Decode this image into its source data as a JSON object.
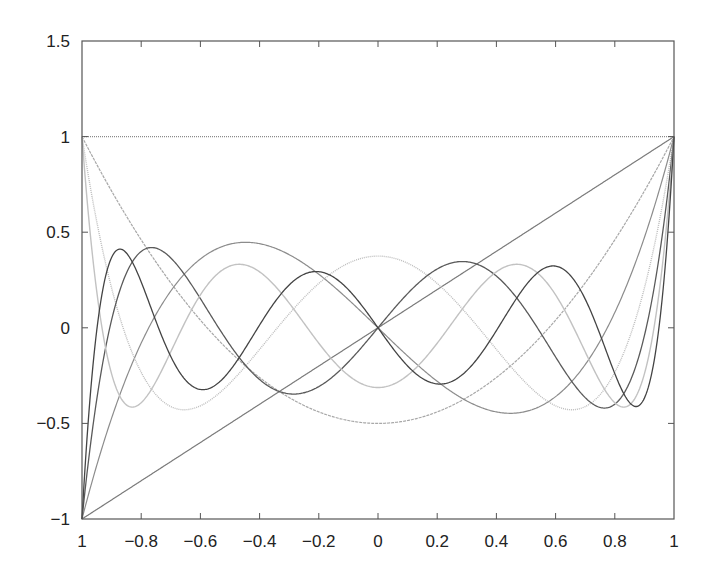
{
  "chart_data": {
    "type": "line",
    "title": "",
    "xlabel": "",
    "ylabel": "",
    "xlim": [
      -1,
      1
    ],
    "ylim": [
      -1,
      1.5
    ],
    "grid": false,
    "legend": "none",
    "x_ticks": [
      {
        "value": -1,
        "label": "1"
      },
      {
        "value": -0.8,
        "label": "−0.8"
      },
      {
        "value": -0.6,
        "label": "−0.6"
      },
      {
        "value": -0.4,
        "label": "−0.4"
      },
      {
        "value": -0.2,
        "label": "−0.2"
      },
      {
        "value": 0,
        "label": "0"
      },
      {
        "value": 0.2,
        "label": "0.2"
      },
      {
        "value": 0.4,
        "label": "0.4"
      },
      {
        "value": 0.6,
        "label": "0.6"
      },
      {
        "value": 0.8,
        "label": "0.8"
      },
      {
        "value": 1,
        "label": "1"
      }
    ],
    "y_ticks": [
      {
        "value": -1,
        "label": "−1"
      },
      {
        "value": -0.5,
        "label": "−0.5"
      },
      {
        "value": 0,
        "label": "0"
      },
      {
        "value": 0.5,
        "label": "0.5"
      },
      {
        "value": 1,
        "label": "1"
      },
      {
        "value": 1.5,
        "label": "1.5"
      }
    ],
    "series": [
      {
        "name": "P0",
        "coefficients": [
          1
        ],
        "color": "#8a8a8a",
        "dash": "1,1",
        "width": 1.2
      },
      {
        "name": "P1",
        "coefficients": [
          0,
          1
        ],
        "color": "#7a7a7a",
        "dash": "",
        "width": 1.2
      },
      {
        "name": "P2",
        "coefficients": [
          -0.5,
          0,
          1.5
        ],
        "color": "#a8a8a8",
        "dash": "3,1",
        "width": 1.2
      },
      {
        "name": "P3",
        "coefficients": [
          0,
          -1.5,
          0,
          2.5
        ],
        "color": "#8c8c8c",
        "dash": "",
        "width": 1.2
      },
      {
        "name": "P4",
        "coefficients": [
          0.375,
          0,
          -3.75,
          0,
          4.375
        ],
        "color": "#bdbdbd",
        "dash": "1,1",
        "width": 1.4
      },
      {
        "name": "P5",
        "coefficients": [
          0,
          1.875,
          0,
          -8.75,
          0,
          7.875
        ],
        "color": "#5a5a5a",
        "dash": "",
        "width": 1.3
      },
      {
        "name": "P6",
        "coefficients": [
          -0.3125,
          0,
          6.5625,
          0,
          -19.6875,
          0,
          14.4375
        ],
        "color": "#c2c2c2",
        "dash": "",
        "width": 1.4
      },
      {
        "name": "P7",
        "coefficients": [
          0,
          -2.1875,
          0,
          19.6875,
          0,
          -43.3125,
          0,
          26.8125
        ],
        "color": "#444444",
        "dash": "",
        "width": 1.3
      }
    ],
    "sample_values": {
      "x": [
        -1,
        -0.8,
        -0.6,
        -0.4,
        -0.2,
        0,
        0.2,
        0.4,
        0.6,
        0.8,
        1
      ],
      "P0": [
        1,
        1,
        1,
        1,
        1,
        1,
        1,
        1,
        1,
        1,
        1
      ],
      "P1": [
        -1,
        -0.8,
        -0.6,
        -0.4,
        -0.2,
        0,
        0.2,
        0.4,
        0.6,
        0.8,
        1
      ],
      "P2": [
        1,
        0.46,
        0.04,
        -0.26,
        -0.44,
        -0.5,
        -0.44,
        -0.26,
        0.04,
        0.46,
        1
      ],
      "P3": [
        -1,
        0.08,
        0.36,
        0.44,
        0.28,
        0,
        -0.28,
        -0.44,
        -0.36,
        -0.08,
        1
      ],
      "P4": [
        1,
        -0.233,
        -0.408,
        -0.113,
        0.232,
        0.375,
        0.232,
        -0.113,
        -0.408,
        -0.233,
        1
      ],
      "P5": [
        -1,
        -0.399,
        0.153,
        0.365,
        0.308,
        0,
        -0.308,
        -0.365,
        -0.153,
        0.399,
        1
      ],
      "P6": [
        1,
        0.121,
        0.323,
        -0.129,
        -0.161,
        -0.3125,
        -0.161,
        -0.129,
        0.323,
        0.121,
        1
      ],
      "P7": [
        -1,
        0.382,
        -0.125,
        -0.367,
        0.333,
        0,
        -0.333,
        0.367,
        0.125,
        -0.382,
        1
      ]
    },
    "plot_area_px": {
      "left": 82,
      "top": 41,
      "right": 674,
      "bottom": 519
    },
    "axis_color": "#555555"
  }
}
